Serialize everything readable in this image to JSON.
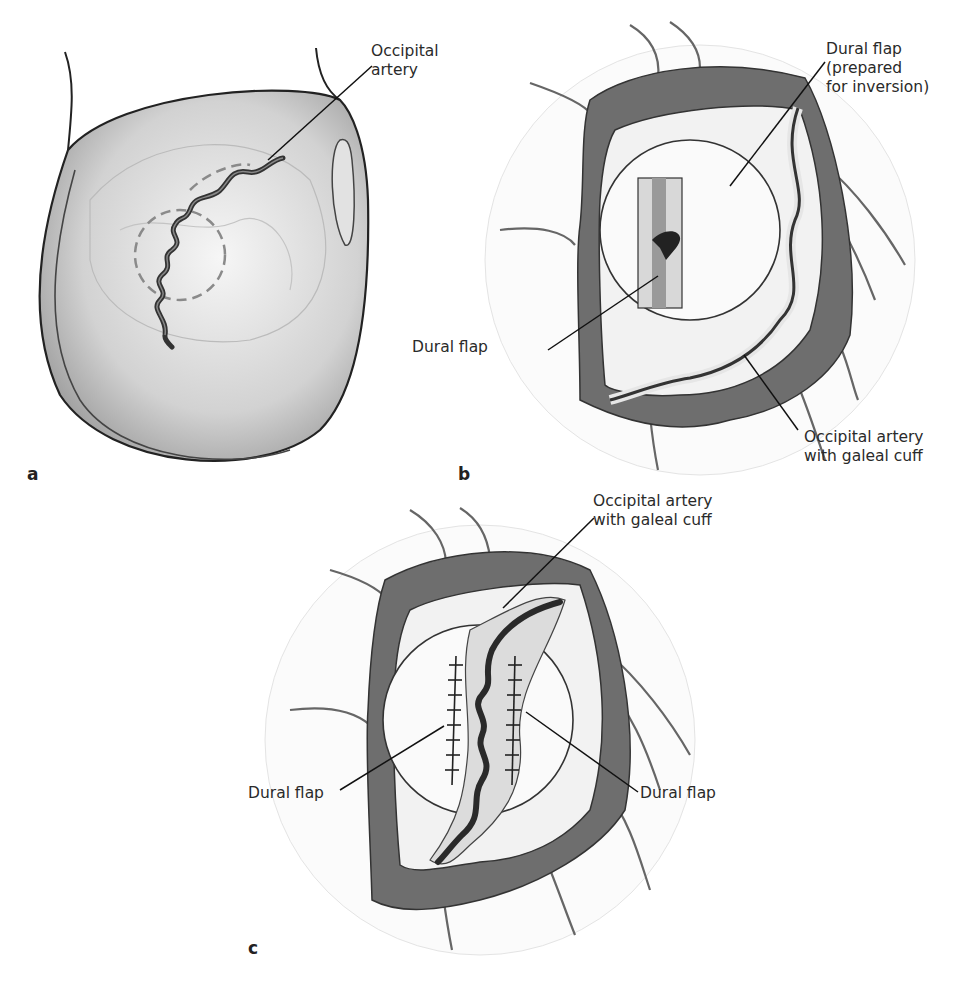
{
  "figure": {
    "panels": [
      {
        "letter": "a",
        "labels": [
          {
            "text": "Occipital\nartery"
          }
        ]
      },
      {
        "letter": "b",
        "labels": [
          {
            "text": "Dural flap\n(prepared\nfor inversion)"
          },
          {
            "text": "Dural flap"
          },
          {
            "text": "Occipital artery\nwith galeal cuff"
          }
        ]
      },
      {
        "letter": "c",
        "labels": [
          {
            "text": "Occipital artery\nwith galeal cuff"
          },
          {
            "text": "Dural flap"
          },
          {
            "text": "Dural flap"
          }
        ]
      }
    ]
  },
  "colors": {
    "outline": "#222222",
    "scalp": "#6e6e6e",
    "dura": "#f4f4f4",
    "skin": "#d8d8d8"
  }
}
